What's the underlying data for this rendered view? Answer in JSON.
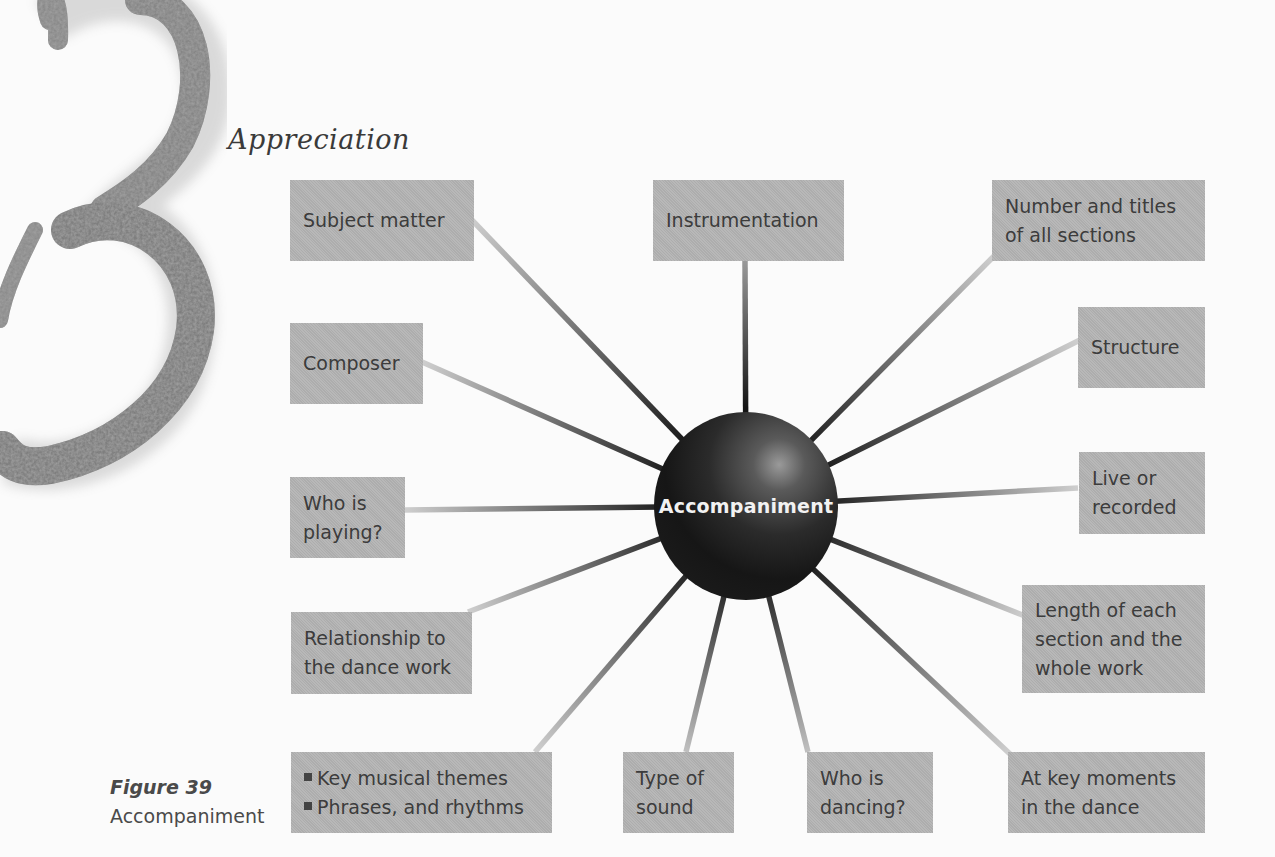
{
  "page": {
    "chapter_numeral": "3",
    "section_title": "Appreciation"
  },
  "diagram": {
    "center": {
      "label": "Accompaniment"
    },
    "nodes": [
      {
        "id": "subject-matter",
        "lines": [
          "Subject matter"
        ]
      },
      {
        "id": "instrumentation",
        "lines": [
          "Instrumentation"
        ]
      },
      {
        "id": "number-and-titles",
        "lines": [
          "Number and titles",
          "of all sections"
        ]
      },
      {
        "id": "structure",
        "lines": [
          "Structure"
        ]
      },
      {
        "id": "composer",
        "lines": [
          "Composer"
        ]
      },
      {
        "id": "live-or-recorded",
        "lines": [
          "Live or",
          "recorded"
        ]
      },
      {
        "id": "who-is-playing",
        "lines": [
          "Who is",
          "playing?"
        ]
      },
      {
        "id": "length-of-sections",
        "lines": [
          "Length of each",
          "section and the",
          "whole work"
        ]
      },
      {
        "id": "relationship-to-dance",
        "lines": [
          "Relationship to",
          "the dance work"
        ]
      },
      {
        "id": "musical-themes",
        "bullets": [
          "Key musical themes",
          "Phrases, and rhythms"
        ]
      },
      {
        "id": "type-of-sound",
        "lines": [
          "Type of",
          "sound"
        ]
      },
      {
        "id": "who-is-dancing",
        "lines": [
          "Who is",
          "dancing?"
        ]
      },
      {
        "id": "key-moments",
        "lines": [
          "At key moments",
          "in the dance"
        ]
      }
    ],
    "colors": {
      "node_fill": "#b4b4b4",
      "node_text": "#3c3c3c",
      "hub_fill": "#1c1c1c",
      "hub_text": "#f2f2f2",
      "spoke_light": "#c8c8c8",
      "spoke_dark": "#151515"
    }
  },
  "caption": {
    "figure_number": "Figure 39",
    "figure_title": "Accompaniment"
  }
}
